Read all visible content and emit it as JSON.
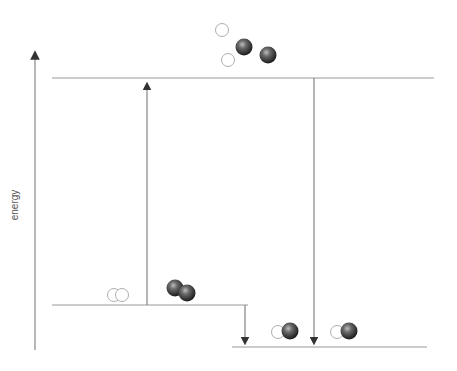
{
  "diagram": {
    "type": "energy-level-diagram",
    "axis": {
      "label": "energy",
      "direction": "up"
    },
    "levels": [
      {
        "name": "separated-atoms",
        "description": "2 H atoms + 2 dark atoms, separated",
        "y": 78
      },
      {
        "name": "reactants",
        "description": "H2 + X2 molecules",
        "y": 305
      },
      {
        "name": "products",
        "description": "2 HX molecules",
        "y": 347
      }
    ],
    "arrows": [
      {
        "name": "bond-breaking-arrow",
        "direction": "up",
        "from": "reactants",
        "to": "separated-atoms"
      },
      {
        "name": "bond-forming-arrow",
        "direction": "down",
        "from": "separated-atoms",
        "to": "products"
      },
      {
        "name": "net-energy-change-arrow",
        "direction": "down",
        "from": "reactants",
        "to": "products"
      }
    ],
    "colors": {
      "line": "#888888",
      "atom_dark": "#3a3a3a",
      "atom_light": "#ffffff"
    }
  }
}
